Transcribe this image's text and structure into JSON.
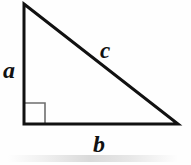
{
  "figure": {
    "name": "right-triangle",
    "background_color": "#fefefe",
    "stroke_color": "#111111",
    "stroke_width": 3,
    "right_angle_marker": {
      "present": true,
      "stroke_color": "#6e6e6e",
      "stroke_width": 1.6,
      "size": 21
    },
    "vertices": {
      "apex": {
        "x": 24,
        "y": 4
      },
      "right_angle": {
        "x": 24,
        "y": 124
      },
      "base_right": {
        "x": 178,
        "y": 124
      }
    }
  },
  "labels": {
    "leg_vertical": "a",
    "leg_horizontal": "b",
    "hypotenuse": "c"
  },
  "chart_data": {
    "type": "diagram",
    "shape": "right-triangle",
    "sides": [
      {
        "name": "a",
        "role": "vertical-leg",
        "from": "apex",
        "to": "right_angle",
        "length_px": 120
      },
      {
        "name": "b",
        "role": "horizontal-leg",
        "from": "right_angle",
        "to": "base_right",
        "length_px": 154
      },
      {
        "name": "c",
        "role": "hypotenuse",
        "from": "apex",
        "to": "base_right",
        "length_px": 195
      }
    ],
    "angles": [
      {
        "at": "right_angle",
        "degrees": 90,
        "marked": true
      }
    ],
    "legend": [],
    "grid": false
  }
}
